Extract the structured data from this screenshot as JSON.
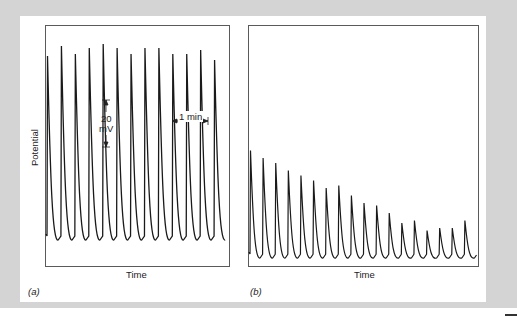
{
  "figure": {
    "panels": [
      {
        "tag_open": "(",
        "tag_letter": "a",
        "tag_close": ")",
        "x_label": "Time",
        "y_label": "Potential",
        "scale_bar_voltage": {
          "value": "20",
          "unit": "mV"
        },
        "scale_bar_time": "1 min"
      },
      {
        "tag_open": "(",
        "tag_letter": "b",
        "tag_close": ")",
        "x_label": "Time"
      }
    ]
  },
  "chart_data": [
    {
      "type": "line",
      "title": "(a)",
      "xlabel": "Time",
      "ylabel": "Potential",
      "annotations": [
        "20 mV",
        "1 min"
      ],
      "description": "Regular periodic spikes of roughly constant amplitude (~40 mV peak-to-trough)",
      "spike_count": 13,
      "peak_rel_amplitude": [
        0.92,
        0.97,
        0.93,
        0.96,
        0.98,
        0.96,
        0.93,
        0.96,
        0.96,
        0.93,
        0.93,
        0.95,
        0.9
      ],
      "grid": false
    },
    {
      "type": "line",
      "title": "(b)",
      "xlabel": "Time",
      "ylabel": "Potential",
      "description": "Spikes with progressively decreasing amplitude and increasing frequency",
      "spike_count": 18,
      "peak_rel_amplitude": [
        0.43,
        0.4,
        0.38,
        0.35,
        0.33,
        0.31,
        0.28,
        0.29,
        0.25,
        0.22,
        0.21,
        0.18,
        0.14,
        0.15,
        0.11,
        0.12,
        0.12,
        0.15
      ],
      "grid": false
    }
  ]
}
